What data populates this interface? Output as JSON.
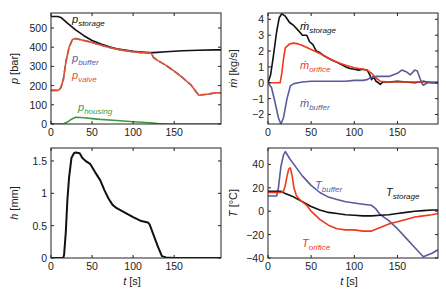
{
  "chart_data": [
    {
      "id": "pressure",
      "type": "line",
      "title": "",
      "xlabel": "",
      "ylabel": "p [bar]",
      "ylabel_var": "p",
      "ylabel_unit": " [bar]",
      "xlim": [
        0,
        207
      ],
      "ylim": [
        0,
        578
      ],
      "xticks": [
        0,
        50,
        100,
        150
      ],
      "yticks": [
        0,
        100,
        200,
        300,
        400,
        500
      ],
      "grid": false,
      "box": {
        "x": 51,
        "y": 13,
        "w": 170,
        "h": 111
      },
      "series": [
        {
          "name": "p_storage",
          "label_main": "p",
          "label_sub": "storage",
          "color": "#111111",
          "label_pos": [
            72,
            23
          ],
          "x": [
            0,
            8,
            12,
            20,
            30,
            40,
            50,
            60,
            70,
            80,
            90,
            100,
            110,
            120,
            125,
            140,
            160,
            180,
            200,
            207
          ],
          "y": [
            560,
            560,
            555,
            525,
            490,
            460,
            435,
            418,
            403,
            392,
            385,
            378,
            375,
            372,
            372,
            376,
            381,
            384,
            386,
            386
          ]
        },
        {
          "name": "p_buffer",
          "label_main": "p",
          "label_sub": "buffer",
          "color": "#5a5a9e",
          "label_pos": [
            72,
            62
          ],
          "x": [
            0,
            8,
            10,
            12,
            15,
            18,
            22,
            26,
            30,
            40,
            50,
            60,
            70,
            80,
            90,
            100,
            110,
            120,
            122,
            125,
            130,
            140,
            150,
            160,
            170,
            180,
            190,
            200,
            207
          ],
          "y": [
            175,
            175,
            178,
            190,
            230,
            320,
            400,
            440,
            445,
            435,
            425,
            412,
            400,
            390,
            382,
            376,
            372,
            369,
            368,
            345,
            330,
            305,
            275,
            242,
            205,
            150,
            155,
            162,
            163
          ]
        },
        {
          "name": "p_valve",
          "label_main": "p",
          "label_sub": "valve",
          "color": "#e05030",
          "label_pos": [
            72,
            79
          ],
          "x": [
            0,
            8,
            10,
            12,
            15,
            18,
            22,
            26,
            30,
            40,
            50,
            60,
            70,
            80,
            90,
            100,
            110,
            120,
            122,
            125,
            130,
            140,
            150,
            160,
            170,
            180,
            190,
            200,
            207
          ],
          "y": [
            175,
            175,
            178,
            190,
            230,
            320,
            400,
            440,
            445,
            435,
            425,
            412,
            400,
            390,
            382,
            376,
            372,
            369,
            368,
            345,
            330,
            305,
            275,
            242,
            205,
            150,
            155,
            162,
            163
          ]
        },
        {
          "name": "p_housing",
          "label_main": "p",
          "label_sub": "housing",
          "color": "#3f9a3f",
          "label_pos": [
            78,
            111
          ],
          "x": [
            0,
            15,
            20,
            25,
            30,
            40,
            50,
            60,
            80,
            100,
            120,
            130,
            140,
            150,
            207
          ],
          "y": [
            0,
            0,
            10,
            25,
            35,
            33,
            28,
            24,
            18,
            12,
            6,
            2,
            0,
            0,
            0
          ]
        }
      ]
    },
    {
      "id": "massflow",
      "type": "line",
      "title": "",
      "xlabel": "",
      "ylabel": "ṁ [kg/s]",
      "ylabel_var": "ṁ",
      "ylabel_unit": " [kg/s]",
      "xlim": [
        0,
        197
      ],
      "ylim": [
        -2.6,
        4.4
      ],
      "xticks": [
        0,
        50,
        100,
        150
      ],
      "yticks": [
        -2,
        -1,
        0,
        1,
        2,
        3,
        4
      ],
      "grid": false,
      "box": {
        "x": 268,
        "y": 13,
        "w": 170,
        "h": 111
      },
      "series": [
        {
          "name": "m_storage",
          "label_main": "ṁ",
          "label_sub": "storage",
          "color": "#111111",
          "label_pos": [
            300,
            30
          ],
          "x": [
            0,
            3,
            6,
            10,
            13,
            16,
            20,
            25,
            30,
            35,
            40,
            45,
            48,
            52,
            56,
            60,
            65,
            70,
            75,
            80,
            85,
            90,
            95,
            100,
            105,
            110,
            115,
            118,
            120,
            122,
            125,
            128,
            130,
            133,
            140,
            150,
            160,
            170,
            180,
            190,
            197
          ],
          "y": [
            0,
            0.5,
            1.6,
            3.2,
            4.1,
            4.35,
            4.2,
            3.8,
            3.6,
            3.3,
            3.0,
            3.0,
            2.6,
            2.4,
            2.0,
            1.9,
            1.7,
            1.55,
            1.4,
            1.3,
            1.15,
            1.0,
            0.9,
            0.85,
            0.8,
            0.85,
            0.8,
            0.5,
            0.2,
            0.4,
            0.1,
            0.0,
            -0.1,
            0.05,
            0.05,
            0.1,
            0.05,
            0.0,
            0.1,
            0.0,
            0.0
          ]
        },
        {
          "name": "m_orifice",
          "label_main": "ṁ",
          "label_sub": "orifice",
          "color": "#ee3a1a",
          "label_pos": [
            300,
            69
          ],
          "x": [
            0,
            14,
            16,
            18,
            20,
            25,
            30,
            35,
            40,
            50,
            60,
            70,
            80,
            90,
            100,
            110,
            115,
            120,
            125,
            130,
            140,
            150,
            160,
            170,
            180,
            190,
            197
          ],
          "y": [
            0,
            0,
            0.6,
            1.5,
            2.2,
            2.45,
            2.5,
            2.45,
            2.35,
            2.1,
            1.85,
            1.55,
            1.3,
            1.1,
            0.95,
            0.85,
            0.8,
            0.6,
            0.3,
            0.1,
            0.05,
            0.05,
            0.05,
            0.05,
            0.05,
            0.05,
            0.05
          ]
        },
        {
          "name": "m_buffer",
          "label_main": "ṁ",
          "label_sub": "buffer",
          "color": "#5a5a9e",
          "label_pos": [
            300,
            107
          ],
          "x": [
            0,
            4,
            8,
            12,
            15,
            18,
            22,
            26,
            30,
            35,
            40,
            50,
            60,
            70,
            80,
            90,
            100,
            110,
            115,
            118,
            122,
            126,
            130,
            140,
            150,
            155,
            160,
            165,
            170,
            173,
            178,
            180,
            185,
            190,
            197
          ],
          "y": [
            0,
            -0.3,
            -1.2,
            -2.2,
            -2.6,
            -2.2,
            -1.0,
            -0.2,
            -0.05,
            0.0,
            0.05,
            0.1,
            0.1,
            0.1,
            0.1,
            0.1,
            0.15,
            0.15,
            0.2,
            0.3,
            0.35,
            0.4,
            0.4,
            0.4,
            0.6,
            0.8,
            0.7,
            0.5,
            0.8,
            0.75,
            0.0,
            -0.15,
            0.0,
            0.0,
            0.0
          ]
        }
      ]
    },
    {
      "id": "lift",
      "type": "line",
      "title": "",
      "xlabel": "t [s]",
      "xlabel_var": "t",
      "xlabel_unit": " [s]",
      "ylabel": "h [mm]",
      "ylabel_var": "h",
      "ylabel_unit": " [mm]",
      "xlim": [
        0,
        207
      ],
      "ylim": [
        0,
        1.7
      ],
      "xticks": [
        0,
        50,
        100,
        150
      ],
      "yticks": [
        0,
        0.5,
        1,
        1.5
      ],
      "grid": false,
      "box": {
        "x": 51,
        "y": 148,
        "w": 170,
        "h": 110
      },
      "series": [
        {
          "name": "h",
          "label_main": "",
          "label_sub": "",
          "color": "#111111",
          "label_pos": [
            0,
            0
          ],
          "x": [
            0,
            15,
            16,
            18,
            20,
            22,
            25,
            28,
            30,
            35,
            38,
            42,
            48,
            55,
            60,
            65,
            70,
            75,
            80,
            90,
            100,
            110,
            118,
            120,
            125,
            130,
            135,
            140,
            150,
            207
          ],
          "y": [
            0,
            0,
            0.05,
            0.4,
            0.9,
            1.25,
            1.55,
            1.62,
            1.63,
            1.62,
            1.55,
            1.5,
            1.45,
            1.3,
            1.2,
            1.05,
            0.92,
            0.82,
            0.77,
            0.7,
            0.63,
            0.57,
            0.55,
            0.52,
            0.35,
            0.18,
            0.03,
            0.01,
            0,
            0
          ]
        }
      ]
    },
    {
      "id": "temperature",
      "type": "line",
      "title": "",
      "xlabel": "t [s]",
      "xlabel_var": "t",
      "xlabel_unit": " [s]",
      "ylabel": "T [°C]",
      "ylabel_var": "T",
      "ylabel_unit": " [°C]",
      "xlim": [
        0,
        197
      ],
      "ylim": [
        -40,
        54
      ],
      "xticks": [
        0,
        50,
        100,
        150
      ],
      "yticks": [
        -40,
        -20,
        0,
        20,
        40
      ],
      "grid": false,
      "box": {
        "x": 268,
        "y": 148,
        "w": 170,
        "h": 110
      },
      "series": [
        {
          "name": "T_buffer",
          "label_main": "T",
          "label_sub": "buffer",
          "color": "#5a5a9e",
          "label_pos": [
            315,
            189
          ],
          "x": [
            0,
            10,
            12,
            15,
            18,
            20,
            25,
            30,
            40,
            50,
            60,
            70,
            80,
            90,
            100,
            110,
            120,
            125,
            130,
            140,
            150,
            160,
            170,
            180,
            190,
            197
          ],
          "y": [
            13,
            13,
            20,
            38,
            48,
            51,
            45,
            40,
            30,
            22,
            16,
            12,
            10,
            8,
            7,
            6,
            5,
            2,
            -3,
            -8,
            -15,
            -23,
            -31,
            -39,
            -36,
            -33
          ]
        },
        {
          "name": "T_storage",
          "label_main": "T",
          "label_sub": "storage",
          "color": "#111111",
          "label_pos": [
            386,
            196
          ],
          "x": [
            0,
            10,
            15,
            20,
            30,
            40,
            50,
            60,
            70,
            80,
            90,
            100,
            110,
            120,
            130,
            140,
            150,
            160,
            170,
            180,
            190,
            197
          ],
          "y": [
            17,
            17,
            17,
            15,
            12,
            8,
            4,
            1,
            -1,
            -2,
            -3,
            -3.5,
            -4,
            -4,
            -3.5,
            -3,
            -2,
            -1,
            0,
            0.5,
            1,
            1
          ]
        },
        {
          "name": "T_orifice",
          "label_main": "T",
          "label_sub": "orifice",
          "color": "#ee3a1a",
          "label_pos": [
            302,
            247
          ],
          "x": [
            0,
            10,
            15,
            18,
            20,
            22,
            24,
            26,
            28,
            30,
            33,
            38,
            45,
            50,
            60,
            70,
            80,
            90,
            100,
            110,
            120,
            130,
            140,
            150,
            160,
            170,
            180,
            190,
            197
          ],
          "y": [
            16,
            16,
            16,
            17,
            22,
            30,
            36,
            37,
            30,
            20,
            13,
            9,
            5,
            0,
            -7,
            -12,
            -15,
            -16,
            -16,
            -17,
            -17,
            -14,
            -11,
            -9,
            -7,
            -5,
            -4,
            -3,
            -2
          ]
        }
      ]
    }
  ]
}
